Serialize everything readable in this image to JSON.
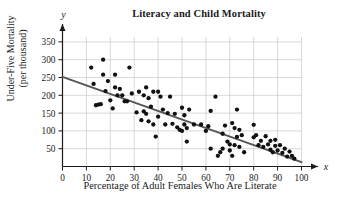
{
  "chart_data": {
    "type": "scatter",
    "title": "Literacy and Child Mortality",
    "xlabel": "Percentage of Adult Females Who Are Literate",
    "ylabel_line1": "Under-Five Mortality",
    "ylabel_line2": "(per thousand)",
    "x_axis_name": "x",
    "y_axis_name": "y",
    "xlim": [
      0,
      100
    ],
    "ylim": [
      0,
      375
    ],
    "xticks": [
      0,
      10,
      20,
      30,
      40,
      50,
      60,
      70,
      80,
      90,
      100
    ],
    "yticks": [
      50,
      100,
      150,
      200,
      250,
      300,
      350
    ],
    "grid": true,
    "legend": "none",
    "point_color": "#111111",
    "line_color": "#555555",
    "grid_color": "#c9c9c9",
    "axis_color": "#1a1a1a",
    "trendline": {
      "label": "least-squares regression line",
      "x": [
        0,
        100
      ],
      "y": [
        252,
        12
      ]
    },
    "points": [
      [
        12,
        278
      ],
      [
        13,
        232
      ],
      [
        14,
        172
      ],
      [
        15,
        174
      ],
      [
        16,
        175
      ],
      [
        17,
        300
      ],
      [
        17,
        258
      ],
      [
        18,
        212
      ],
      [
        19,
        240
      ],
      [
        20,
        186
      ],
      [
        21,
        163
      ],
      [
        22,
        258
      ],
      [
        22,
        222
      ],
      [
        23,
        200
      ],
      [
        24,
        218
      ],
      [
        25,
        200
      ],
      [
        26,
        183
      ],
      [
        27,
        183
      ],
      [
        28,
        278
      ],
      [
        29,
        205
      ],
      [
        31,
        152
      ],
      [
        32,
        210
      ],
      [
        33,
        130
      ],
      [
        34,
        200
      ],
      [
        34,
        155
      ],
      [
        35,
        148
      ],
      [
        35,
        222
      ],
      [
        36,
        192
      ],
      [
        36,
        127
      ],
      [
        37,
        168
      ],
      [
        38,
        210
      ],
      [
        38,
        118
      ],
      [
        39,
        84
      ],
      [
        40,
        210
      ],
      [
        40,
        140
      ],
      [
        41,
        196
      ],
      [
        42,
        160
      ],
      [
        43,
        118
      ],
      [
        44,
        150
      ],
      [
        45,
        196
      ],
      [
        46,
        120
      ],
      [
        47,
        148
      ],
      [
        48,
        110
      ],
      [
        49,
        103
      ],
      [
        50,
        165
      ],
      [
        50,
        100
      ],
      [
        51,
        144
      ],
      [
        51,
        118
      ],
      [
        52,
        70
      ],
      [
        52,
        108
      ],
      [
        53,
        160
      ],
      [
        55,
        118
      ],
      [
        58,
        118
      ],
      [
        60,
        100
      ],
      [
        61,
        113
      ],
      [
        62,
        50
      ],
      [
        62,
        156
      ],
      [
        64,
        196
      ],
      [
        65,
        30
      ],
      [
        66,
        40
      ],
      [
        67,
        92
      ],
      [
        67,
        50
      ],
      [
        68,
        115
      ],
      [
        69,
        70
      ],
      [
        70,
        62
      ],
      [
        70,
        45
      ],
      [
        71,
        122
      ],
      [
        71,
        30
      ],
      [
        72,
        108
      ],
      [
        72,
        60
      ],
      [
        73,
        160
      ],
      [
        73,
        83
      ],
      [
        74,
        55
      ],
      [
        74,
        103
      ],
      [
        75,
        88
      ],
      [
        76,
        40
      ],
      [
        80,
        117
      ],
      [
        80,
        82
      ],
      [
        81,
        88
      ],
      [
        82,
        60
      ],
      [
        83,
        72
      ],
      [
        84,
        55
      ],
      [
        85,
        85
      ],
      [
        86,
        62
      ],
      [
        87,
        72
      ],
      [
        87,
        47
      ],
      [
        88,
        40
      ],
      [
        89,
        75
      ],
      [
        89,
        58
      ],
      [
        90,
        45
      ],
      [
        91,
        60
      ],
      [
        92,
        38
      ],
      [
        93,
        50
      ],
      [
        94,
        28
      ],
      [
        95,
        42
      ],
      [
        96,
        30
      ],
      [
        97,
        22
      ]
    ]
  }
}
